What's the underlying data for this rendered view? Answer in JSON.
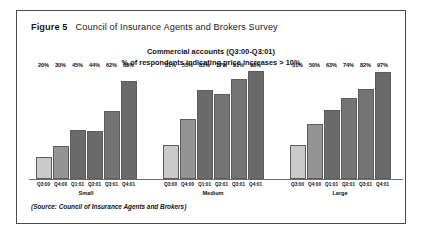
{
  "figure": {
    "number_label": "Figure 5",
    "title": "Council of Insurance Agents and Brokers Survey",
    "source_note": "(Source: Council of Insurance Agents and Brokers)"
  },
  "subtitle": {
    "line1": "Commercial accounts (Q3:00-Q3:01)",
    "line2": "% of respondents indicating price increases > 10%"
  },
  "colors": {
    "bar_light": "#c9c9c9",
    "bar_medium": "#949494",
    "bar_dark": "#6a6a6a",
    "bar_dark_alt": "#747474",
    "border": "#4a4a4a",
    "axis": "#6d6d6d",
    "text": "#111111",
    "page_background": "#ffffff"
  },
  "chart_data": {
    "type": "bar",
    "title": "Commercial accounts (Q3:00-Q3:01)",
    "subtitle": "% of respondents indicating price increases > 10%",
    "xlabel": "",
    "ylabel": "",
    "ylim": [
      0,
      100
    ],
    "grid": false,
    "legend": "none",
    "categories": [
      "Q3:00",
      "Q4:00",
      "Q1:01",
      "Q2:01",
      "Q3:01",
      "Q4:01"
    ],
    "groups": [
      {
        "name": "Small",
        "values": [
          20,
          30,
          45,
          44,
          62,
          89
        ],
        "value_labels": [
          "20%",
          "30%",
          "45%",
          "44%",
          "62%",
          "89%"
        ],
        "bar_colors": [
          "#c9c9c9",
          "#949494",
          "#6a6a6a",
          "#6a6a6a",
          "#747474",
          "#6a6a6a"
        ]
      },
      {
        "name": "Medium",
        "values": [
          31,
          55,
          81,
          77,
          91,
          98
        ],
        "value_labels": [
          "31%",
          "55%",
          "81%",
          "77%",
          "91%",
          "98%"
        ],
        "bar_colors": [
          "#c9c9c9",
          "#949494",
          "#6a6a6a",
          "#747474",
          "#747474",
          "#6a6a6a"
        ]
      },
      {
        "name": "Large",
        "values": [
          31,
          50,
          63,
          74,
          82,
          97
        ],
        "value_labels": [
          "31%",
          "50%",
          "63%",
          "74%",
          "82%",
          "97%"
        ],
        "bar_colors": [
          "#c9c9c9",
          "#949494",
          "#6a6a6a",
          "#747474",
          "#747474",
          "#6a6a6a"
        ]
      }
    ]
  }
}
